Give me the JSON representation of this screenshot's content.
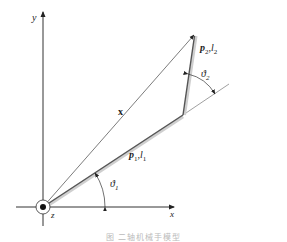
{
  "diagram": {
    "axes": {
      "x_label": "x",
      "y_label": "y",
      "z_label": "z"
    },
    "vectors": {
      "end_effector_label": "x"
    },
    "links": [
      {
        "name": "link-1",
        "label_p": "p",
        "label_p_sub": "1",
        "label_l": "l",
        "label_l_sub": "1"
      },
      {
        "name": "link-2",
        "label_p": "p",
        "label_p_sub": "2",
        "label_l": "l",
        "label_l_sub": "2"
      }
    ],
    "angles": [
      {
        "name": "theta-1",
        "symbol": "ϑ",
        "sub": "1"
      },
      {
        "name": "theta-2",
        "symbol": "ϑ",
        "sub": "2"
      }
    ],
    "caption": "图      二轴机械手模型",
    "colors": {
      "axis": "#333333",
      "link": "#555555",
      "link_shadow": "#c8c8c8",
      "thin_line": "#444444"
    }
  }
}
